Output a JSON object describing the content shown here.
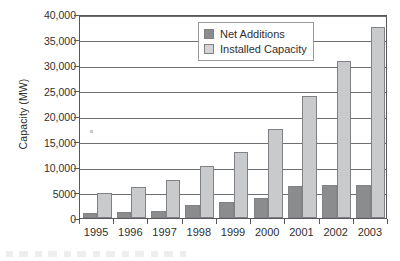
{
  "chart_data": {
    "type": "bar",
    "title": "",
    "xlabel": "",
    "ylabel": "Capacity (MW)",
    "ylim": [
      0,
      40000
    ],
    "yticks": [
      0,
      5000,
      10000,
      15000,
      20000,
      25000,
      30000,
      35000,
      40000
    ],
    "ytick_labels": [
      "0",
      "5000",
      "10,000",
      "15,000",
      "20,000",
      "25,000",
      "30,000",
      "35,000",
      "40,000"
    ],
    "grid": true,
    "legend_position": "top-center-inside",
    "categories": [
      "1995",
      "1996",
      "1997",
      "1998",
      "1999",
      "2000",
      "2001",
      "2002",
      "2003"
    ],
    "series": [
      {
        "name": "Net Additions",
        "color": "#8a8c8e",
        "values": [
          1000,
          1200,
          1450,
          2500,
          3100,
          4000,
          6300,
          6400,
          6400
        ]
      },
      {
        "name": "Installed Capacity",
        "color": "#c9cacb",
        "values": [
          4950,
          6100,
          7500,
          10200,
          13000,
          17400,
          24000,
          30700,
          37500
        ]
      }
    ]
  },
  "legend": {
    "items": [
      {
        "label": "Net Additions",
        "swatch": "net"
      },
      {
        "label": "Installed Capacity",
        "swatch": "installed"
      }
    ]
  }
}
